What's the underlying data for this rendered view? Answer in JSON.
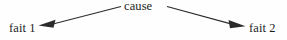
{
  "diagram": {
    "background_color": "#fefefe",
    "stroke_color": "#2b2b2b",
    "nodes": {
      "cause": "cause",
      "fact_left": "fait 1",
      "fact_right": "fait 2"
    },
    "edges": [
      {
        "name": "cause-to-fait-1",
        "from": "cause",
        "to": "fait 1",
        "direction": "left",
        "arrowhead": "filled-triangle"
      },
      {
        "name": "cause-to-fait-2",
        "from": "cause",
        "to": "fait 2",
        "direction": "right",
        "arrowhead": "filled-triangle"
      }
    ]
  }
}
